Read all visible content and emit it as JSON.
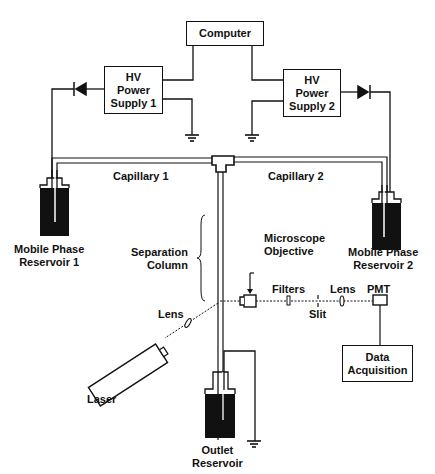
{
  "diagram": {
    "type": "schematic",
    "colors": {
      "line": "#111111",
      "background": "#ffffff",
      "reservoir_fill": "#111111"
    }
  },
  "computer": {
    "label": "Computer"
  },
  "hv_supply_1": {
    "line1": "HV",
    "line2": "Power",
    "line3": "Supply 1"
  },
  "hv_supply_2": {
    "line1": "HV",
    "line2": "Power",
    "line3": "Supply 2"
  },
  "capillary_1": {
    "label": "Capillary 1"
  },
  "capillary_2": {
    "label": "Capillary 2"
  },
  "reservoir_1": {
    "line1": "Mobile Phase",
    "line2": "Reservoir 1"
  },
  "reservoir_2": {
    "line1": "Mobile Phase",
    "line2": "Reservoir 2"
  },
  "separation_column": {
    "line1": "Separation",
    "line2": "Column"
  },
  "microscope_objective": {
    "line1": "Microscope",
    "line2": "Objective"
  },
  "optics": {
    "filters": "Filters",
    "slit": "Slit",
    "lens_detect": "Lens",
    "pmt": "PMT",
    "lens_laser": "Lens",
    "laser": "Laser"
  },
  "data_acquisition": {
    "line1": "Data",
    "line2": "Acquisition"
  },
  "outlet_reservoir": {
    "line1": "Outlet",
    "line2": "Reservoir"
  }
}
